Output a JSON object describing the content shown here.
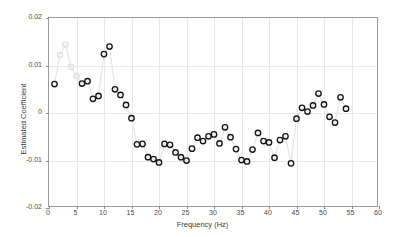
{
  "chart_data": {
    "type": "scatter",
    "title": "",
    "xlabel": "Frequency (Hz)",
    "ylabel": "Estimated Coefficient",
    "xlim": [
      0,
      60
    ],
    "ylim": [
      -0.02,
      0.02
    ],
    "xticks": [
      0,
      5,
      10,
      15,
      20,
      25,
      30,
      35,
      40,
      45,
      50,
      55,
      60
    ],
    "xticklabels": [
      "0",
      "5",
      "10",
      "15",
      "20",
      "25",
      "30",
      "35",
      "40",
      "45",
      "50",
      "55",
      "60"
    ],
    "yticks": [
      -0.02,
      -0.01,
      0,
      0.01,
      0.02
    ],
    "yticklabels": [
      "-0.02",
      "-0.01",
      "0",
      "0.01",
      "0.02"
    ],
    "grid": true,
    "legend": null,
    "marker": "circle-open",
    "connector": "light-gray-line",
    "series": [
      {
        "name": "Estimated Coefficient",
        "marker_color": "#141414",
        "faded_marker_color": "#e0e0e0",
        "x": [
          1,
          2,
          3,
          4,
          5,
          6,
          7,
          8,
          9,
          10,
          11,
          12,
          13,
          14,
          15,
          16,
          17,
          18,
          19,
          20,
          21,
          22,
          23,
          24,
          25,
          26,
          27,
          28,
          29,
          30,
          31,
          32,
          33,
          34,
          35,
          36,
          37,
          38,
          39,
          40,
          41,
          42,
          43,
          44,
          45,
          46,
          47,
          48,
          49,
          50,
          51,
          52,
          53,
          54
        ],
        "y": [
          0.0061,
          0.0122,
          0.0144,
          0.0097,
          0.0078,
          0.0062,
          0.0067,
          0.003,
          0.0036,
          0.0124,
          0.014,
          0.005,
          0.0038,
          0.0017,
          -0.0011,
          -0.0066,
          -0.0065,
          -0.0093,
          -0.0097,
          -0.0104,
          -0.0065,
          -0.0067,
          -0.0083,
          -0.0093,
          -0.01,
          -0.0075,
          -0.0052,
          -0.0059,
          -0.0049,
          -0.0045,
          -0.0064,
          -0.003,
          -0.0051,
          -0.0076,
          -0.0099,
          -0.0102,
          -0.0077,
          -0.0042,
          -0.0059,
          -0.0062,
          -0.0094,
          -0.0057,
          -0.0049,
          -0.0106,
          -0.0012,
          0.0011,
          0.0003,
          0.0016,
          0.0041,
          0.0018,
          -0.0008,
          -0.002,
          0.0033,
          0.0009
        ],
        "faded_indices": [
          1,
          2,
          3,
          4
        ]
      }
    ]
  }
}
